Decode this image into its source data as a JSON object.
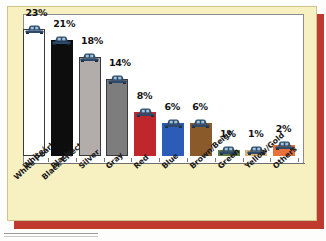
{
  "chart_data": {
    "type": "bar",
    "title": "",
    "subtitle": "",
    "xlabel": "",
    "ylabel": "",
    "grid": false,
    "legend": "none",
    "ylim": [
      0,
      25
    ],
    "categories": [
      "White/\nWhite Pearl",
      "Black/\nBlack Effect",
      "Silver",
      "Gray",
      "Red",
      "Blue",
      "Brown/Beige",
      "Green",
      "Yellow/Gold",
      "Others"
    ],
    "values": [
      23,
      21,
      18,
      14,
      8,
      6,
      6,
      1,
      1,
      2
    ],
    "data_labels": [
      "23%",
      "21%",
      "18%",
      "14%",
      "8%",
      "6%",
      "6%",
      "1%",
      "1%",
      "2%"
    ],
    "bar_colors": [
      "#ffffff",
      "#0d0d0d",
      "#b2acaa",
      "#7d7d7d",
      "#c0272d",
      "#2a5cb8",
      "#8b5a2b",
      "#5d7a3c",
      "#d9b277",
      "#e8703a"
    ],
    "bars": [
      {
        "label": "White/White Pearl",
        "line1": "White/",
        "line2": "White Pearl",
        "value": 23,
        "data_label": "23%",
        "color": "#ffffff",
        "outlined": true
      },
      {
        "label": "Black/Black Effect",
        "line1": "Black/",
        "line2": "Black Effect",
        "value": 21,
        "data_label": "21%",
        "color": "#0d0d0d",
        "outlined": false
      },
      {
        "label": "Silver",
        "line1": "Silver",
        "line2": "",
        "value": 18,
        "data_label": "18%",
        "color": "#b2acaa",
        "outlined": true
      },
      {
        "label": "Gray",
        "line1": "Gray",
        "line2": "",
        "value": 14,
        "data_label": "14%",
        "color": "#7d7d7d",
        "outlined": true
      },
      {
        "label": "Red",
        "line1": "Red",
        "line2": "",
        "value": 8,
        "data_label": "8%",
        "color": "#c0272d",
        "outlined": false
      },
      {
        "label": "Blue",
        "line1": "Blue",
        "line2": "",
        "value": 6,
        "data_label": "6%",
        "color": "#2a5cb8",
        "outlined": false
      },
      {
        "label": "Brown/Beige",
        "line1": "Brown/Beige",
        "line2": "",
        "value": 6,
        "data_label": "6%",
        "color": "#8b5a2b",
        "outlined": false
      },
      {
        "label": "Green",
        "line1": "Green",
        "line2": "",
        "value": 1,
        "data_label": "1%",
        "color": "#5d7a3c",
        "outlined": false
      },
      {
        "label": "Yellow/Gold",
        "line1": "Yellow/Gold",
        "line2": "",
        "value": 1,
        "data_label": "1%",
        "color": "#d9b277",
        "outlined": false
      },
      {
        "label": "Others",
        "line1": "Others",
        "line2": "",
        "value": 2,
        "data_label": "2%",
        "color": "#e8703a",
        "outlined": false
      }
    ],
    "marker_icon": "car-front-icon",
    "marker_color": "#2e4a6b"
  },
  "colors": {
    "card_background": "#f7f0c0",
    "card_border": "#cfc48f",
    "shadow": "#c0392f",
    "plot_background": "#ffffff",
    "plot_border": "#8c8c8c",
    "axis": "#6f6f6f",
    "label_text": "#1a1a1a"
  }
}
